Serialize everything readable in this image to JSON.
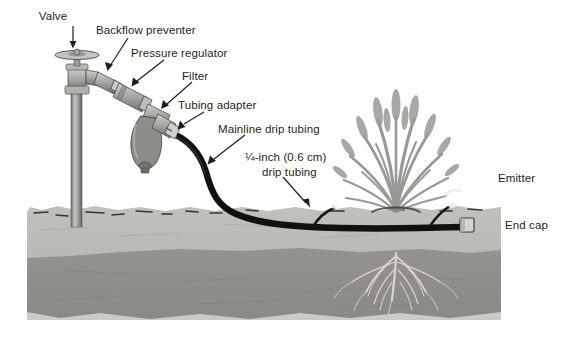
{
  "figure": {
    "background_color": "#ffffff",
    "text_color": "#231f20"
  },
  "labels": [
    {
      "id": "valve",
      "text": "Valve",
      "x": 52,
      "y": 10,
      "align": "center"
    },
    {
      "id": "backflow",
      "text": "Backflow preventer",
      "x": 96,
      "y": 24,
      "align": "left"
    },
    {
      "id": "pressure_regulator",
      "text": "Pressure regulator",
      "x": 131,
      "y": 47,
      "align": "left"
    },
    {
      "id": "filter",
      "text": "Filter",
      "x": 182,
      "y": 70,
      "align": "left"
    },
    {
      "id": "tubing_adapter",
      "text": "Tubing adapter",
      "x": 178,
      "y": 99,
      "align": "left"
    },
    {
      "id": "mainline_tubing",
      "text": "Mainline drip tubing",
      "x": 218,
      "y": 123,
      "align": "left"
    },
    {
      "id": "quarter_inch_1",
      "text": "¼-inch (0.6 cm)",
      "x": 245,
      "y": 151,
      "align": "left"
    },
    {
      "id": "quarter_inch_2",
      "text": "drip tubing",
      "x": 262,
      "y": 166,
      "align": "left"
    },
    {
      "id": "emitter",
      "text": "Emitter",
      "x": 498,
      "y": 172,
      "align": "left"
    },
    {
      "id": "end_cap",
      "text": "End cap",
      "x": 505,
      "y": 219,
      "align": "left"
    }
  ],
  "scene": {
    "topsoil_color": "#b9b7b2",
    "subsoil_color": "#8e8d8a",
    "tubing_color": "#141414",
    "hardware_color": "#9a9a98",
    "plant_color": "#8a8a86",
    "root_color": "#d8d6d1",
    "soil_left": 27,
    "soil_right": 501,
    "ground_line_y": 209,
    "subsoil_line_y": 252,
    "soil_bottom_y": 320
  },
  "components": [
    {
      "name": "valve",
      "description": "hose bib / faucet valve with round handle on riser pipe"
    },
    {
      "name": "backflow-preventer",
      "description": "inline anti-siphon fitting after valve"
    },
    {
      "name": "pressure-regulator",
      "description": "inline pressure regulator body"
    },
    {
      "name": "filter",
      "description": "Y-filter with bowl and flush cap"
    },
    {
      "name": "tubing-adapter",
      "description": "compression adapter connecting filter to mainline tubing"
    },
    {
      "name": "mainline-drip-tubing",
      "description": "thick black mainline tubing running along ground surface"
    },
    {
      "name": "quarter-inch-drip-tubing",
      "description": "thin 1/4-inch branch tubing to plant"
    },
    {
      "name": "emitter",
      "description": "drip emitter at plant base"
    },
    {
      "name": "end-cap",
      "description": "end cap closing mainline tubing"
    },
    {
      "name": "plant",
      "description": "ornamental grass clump"
    },
    {
      "name": "roots",
      "description": "root system below soil surface"
    }
  ]
}
